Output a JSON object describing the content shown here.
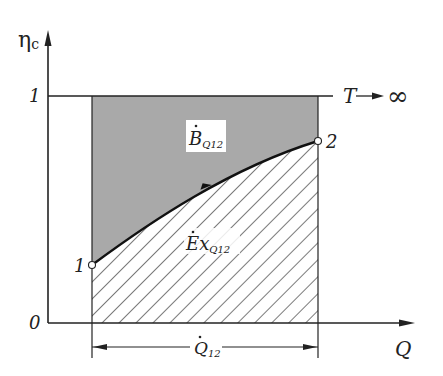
{
  "diagram": {
    "y_axis_label": "η",
    "y_axis_label_sub": "c",
    "x_axis_label": "Q",
    "y_tick_top": "1",
    "y_tick_origin": "0",
    "limit_label": "T",
    "limit_arrow": "→",
    "limit_value": "∞",
    "point_start": "1",
    "point_end": "2",
    "upper_region": {
      "symbol": "B",
      "sub": "Q12",
      "fill": "#a9a9a9"
    },
    "lower_region": {
      "symbol": "Ex",
      "sub": "Q12",
      "pattern": "diagonal-hatch"
    },
    "dimension": {
      "symbol": "Q",
      "sub": "12"
    }
  },
  "colors": {
    "ink": "#222222",
    "shade": "#a9a9a9",
    "background": "#ffffff"
  }
}
